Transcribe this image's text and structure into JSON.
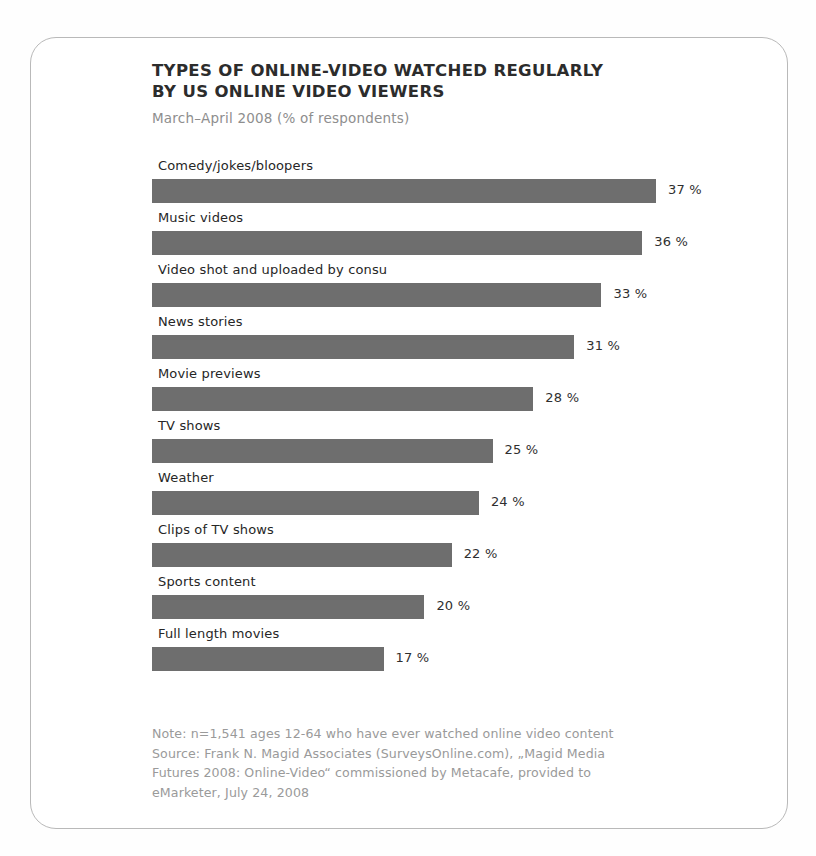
{
  "frame": {
    "border_color": "#b9b9b9",
    "background": "#ffffff"
  },
  "header": {
    "title_line1": "TYPES OF ONLINE-VIDEO WATCHED REGULARLY",
    "title_line2": "BY US ONLINE VIDEO VIEWERS",
    "subtitle": "March–April 2008 (% of respondents)"
  },
  "footnote": {
    "line1": "Note: n=1,541 ages 12-64 who have ever watched online video content",
    "line2": "Source: Frank N. Magid Associates (SurveysOnline.com), „Magid Media",
    "line3": "Futures 2008: Online-Video“ commissioned by Metacafe, provided to",
    "line4": "eMarketer, July 24, 2008"
  },
  "chart_data": {
    "type": "bar",
    "orientation": "horizontal",
    "title": "TYPES OF ONLINE-VIDEO WATCHED REGULARLY BY US ONLINE VIDEO VIEWERS",
    "subtitle": "March–April 2008 (% of respondents)",
    "xlabel": "",
    "ylabel": "",
    "unit": "%",
    "value_suffix": " %",
    "xlim": [
      0,
      37
    ],
    "grid": false,
    "legend": false,
    "bar_color": "#6e6e6e",
    "px_per_unit": 13.62,
    "categories": [
      "Comedy/jokes/bloopers",
      "Music videos",
      "Video shot and uploaded by consu",
      "News stories",
      "Movie previews",
      "TV shows",
      "Weather",
      "Clips of TV shows",
      "Sports content",
      "Full length movies"
    ],
    "values": [
      37,
      36,
      33,
      31,
      28,
      25,
      24,
      22,
      20,
      17
    ],
    "value_labels": [
      "37 %",
      "36 %",
      "33 %",
      "31 %",
      "28 %",
      "25 %",
      "24 %",
      "22 %",
      "20 %",
      "17 %"
    ],
    "note": "Note: n=1,541 ages 12-64 who have ever watched online video content",
    "source": "Source: Frank N. Magid Associates (SurveysOnline.com), „Magid Media Futures 2008: Online-Video“ commissioned by Metacafe, provided to eMarketer, July 24, 2008"
  }
}
